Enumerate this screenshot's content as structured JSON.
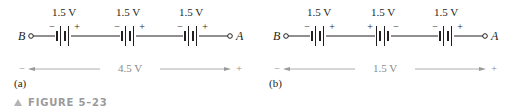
{
  "figure": {
    "caption_label": "FIGURE 5–23"
  },
  "panels": [
    {
      "id": "a",
      "sub_label": "(a)",
      "node_left": "B",
      "node_right": "A",
      "batteries": [
        {
          "voltage": "1.5 V",
          "left_polarity": "−",
          "right_polarity": "+"
        },
        {
          "voltage": "1.5 V",
          "left_polarity": "−",
          "right_polarity": "+"
        },
        {
          "voltage": "1.5 V",
          "left_polarity": "−",
          "right_polarity": "+"
        }
      ],
      "total_voltage": "4.5 V",
      "total_left_polarity": "−",
      "total_right_polarity": "+"
    },
    {
      "id": "b",
      "sub_label": "(b)",
      "node_left": "B",
      "node_right": "A",
      "batteries": [
        {
          "voltage": "1.5 V",
          "left_polarity": "−",
          "right_polarity": "+"
        },
        {
          "voltage": "1.5 V",
          "left_polarity": "+",
          "right_polarity": "−"
        },
        {
          "voltage": "1.5 V",
          "left_polarity": "−",
          "right_polarity": "+"
        }
      ],
      "total_voltage": "1.5 V",
      "total_left_polarity": "−",
      "total_right_polarity": "+"
    }
  ]
}
